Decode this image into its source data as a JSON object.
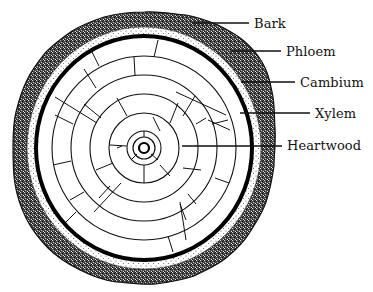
{
  "diagram": {
    "cut_off_caption": "y  p",
    "center": [
      144,
      148
    ],
    "layers": {
      "bark": {
        "outer_rx": 131,
        "outer_ry": 136,
        "inner_r": 117,
        "color": "#2a2a2a"
      },
      "phloem": {
        "outer_r": 116,
        "inner_r": 110,
        "color": "#f4f4f4"
      },
      "cambium": {
        "r": 108,
        "width": 4,
        "color": "#000000"
      },
      "xylem_rings": [
        93,
        74,
        55,
        35,
        17
      ],
      "pith": {
        "outer_r": 11,
        "inner_r": 5
      }
    },
    "labels": [
      {
        "id": "bark",
        "text": "Bark",
        "text_x": 254,
        "text_y": 17,
        "line": [
          192,
          23,
          249,
          23
        ]
      },
      {
        "id": "phloem",
        "text": "Phloem",
        "text_x": 286,
        "text_y": 45,
        "line": [
          231,
          51,
          281,
          51
        ]
      },
      {
        "id": "cambium",
        "text": "Cambium",
        "text_x": 300,
        "text_y": 76,
        "line": [
          241,
          82,
          295,
          82
        ]
      },
      {
        "id": "xylem",
        "text": "Xylem",
        "text_x": 315,
        "text_y": 107,
        "line": [
          240,
          113,
          310,
          113
        ]
      },
      {
        "id": "heartwood",
        "text": "Heartwood",
        "text_x": 287,
        "text_y": 139,
        "line": [
          182,
          146,
          282,
          146
        ]
      }
    ],
    "colors": {
      "ink": "#111111",
      "background": "#ffffff",
      "bark_fill": "#3a3a3a",
      "phloem_dots": "#555555"
    }
  }
}
